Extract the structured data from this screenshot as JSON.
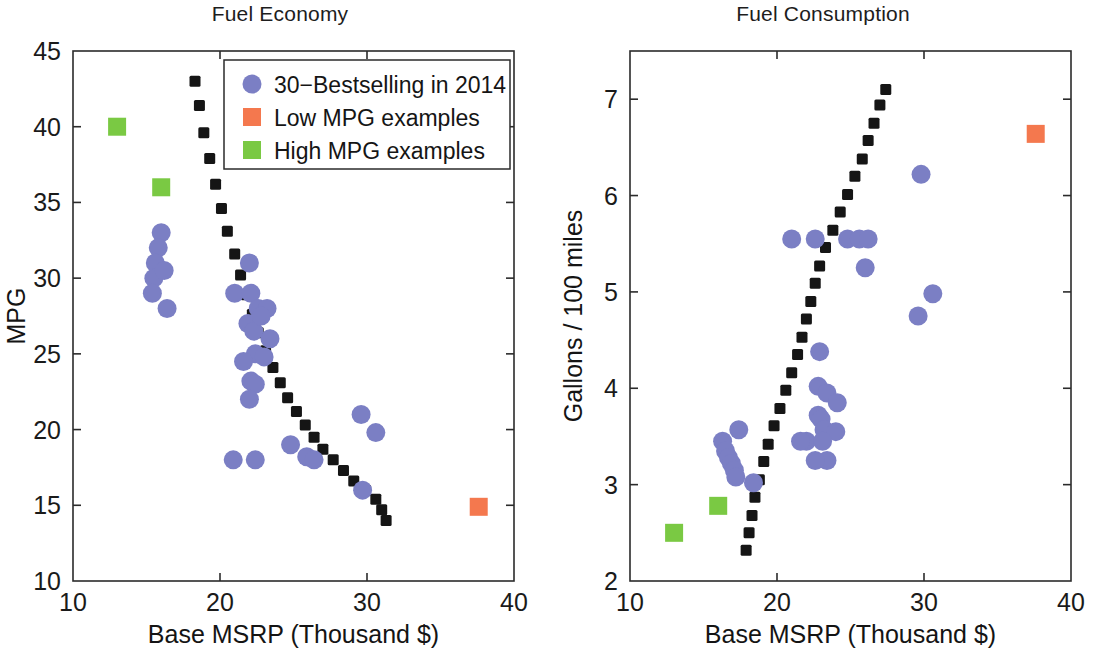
{
  "figure": {
    "width": 1113,
    "height": 649,
    "background": "#ffffff",
    "colors": {
      "bestselling_blue": "#7b7fc4",
      "low_mpg_orange": "#f4784e",
      "high_mpg_green": "#7ac943",
      "trendline_black": "#151515",
      "axis_black": "#2b2b2b"
    }
  },
  "legend": {
    "position": "top-right of left panel",
    "entries": [
      {
        "label": "30−Bestselling in 2014",
        "marker": "circle",
        "color": "#7b7fc4"
      },
      {
        "label": "Low MPG examples",
        "marker": "square",
        "color": "#f4784e"
      },
      {
        "label": "High MPG examples",
        "marker": "square",
        "color": "#7ac943"
      }
    ]
  },
  "chart_data": [
    {
      "id": "fuel-economy",
      "type": "scatter",
      "title": "Fuel Economy",
      "xlabel": "Base MSRP (Thousand $)",
      "ylabel": "MPG",
      "xlim": [
        10,
        40
      ],
      "ylim": [
        10,
        45
      ],
      "xticks": [
        10,
        20,
        30,
        40
      ],
      "xtick_labels": [
        "10",
        "20",
        "30",
        "40"
      ],
      "yticks": [
        10,
        15,
        20,
        25,
        30,
        35,
        40,
        45
      ],
      "ytick_labels": [
        "10",
        "15",
        "20",
        "25",
        "30",
        "35",
        "40",
        "45"
      ],
      "grid": false,
      "legend_position": "upper right",
      "series": [
        {
          "name": "30−Bestselling in 2014",
          "marker": "circle",
          "color": "#7b7fc4",
          "points": [
            [
              16.0,
              33.0
            ],
            [
              15.8,
              32.0
            ],
            [
              15.6,
              31.0
            ],
            [
              15.5,
              30.0
            ],
            [
              15.4,
              29.0
            ],
            [
              16.4,
              28.0
            ],
            [
              21.0,
              29.0
            ],
            [
              22.1,
              29.0
            ],
            [
              22.6,
              28.0
            ],
            [
              23.2,
              28.0
            ],
            [
              22.0,
              31.0
            ],
            [
              21.9,
              27.0
            ],
            [
              22.3,
              26.5
            ],
            [
              23.4,
              26.0
            ],
            [
              22.4,
              25.0
            ],
            [
              22.1,
              23.2
            ],
            [
              22.4,
              23.0
            ],
            [
              29.6,
              21.0
            ],
            [
              30.6,
              19.8
            ],
            [
              24.8,
              19.0
            ],
            [
              25.9,
              18.2
            ],
            [
              26.4,
              18.0
            ],
            [
              20.9,
              18.0
            ],
            [
              22.4,
              18.0
            ],
            [
              29.7,
              16.0
            ],
            [
              22.0,
              22.0
            ],
            [
              16.2,
              30.5
            ],
            [
              22.8,
              27.5
            ],
            [
              21.6,
              24.5
            ],
            [
              23.0,
              24.8
            ]
          ]
        },
        {
          "name": "Low MPG examples",
          "marker": "square",
          "color": "#f4784e",
          "points": [
            [
              37.6,
              14.9
            ]
          ]
        },
        {
          "name": "High MPG examples",
          "marker": "square",
          "color": "#7ac943",
          "points": [
            [
              13.0,
              40.0
            ],
            [
              16.0,
              36.0
            ]
          ]
        }
      ],
      "trendline": {
        "style": "dotted",
        "color": "#151515",
        "description": "decreasing hyperbolic fit",
        "points": [
          [
            18.3,
            43.0
          ],
          [
            18.6,
            41.4
          ],
          [
            18.9,
            39.6
          ],
          [
            19.3,
            37.9
          ],
          [
            19.7,
            36.2
          ],
          [
            20.1,
            34.6
          ],
          [
            20.5,
            33.1
          ],
          [
            21.0,
            31.6
          ],
          [
            21.4,
            30.2
          ],
          [
            21.8,
            28.9
          ],
          [
            22.2,
            27.6
          ],
          [
            22.6,
            26.4
          ],
          [
            23.1,
            25.2
          ],
          [
            23.6,
            24.1
          ],
          [
            24.1,
            23.1
          ],
          [
            24.6,
            22.1
          ],
          [
            25.2,
            21.2
          ],
          [
            25.8,
            20.3
          ],
          [
            26.4,
            19.5
          ],
          [
            27.0,
            18.7
          ],
          [
            27.7,
            18.0
          ],
          [
            28.4,
            17.3
          ],
          [
            29.1,
            16.6
          ],
          [
            29.9,
            16.0
          ],
          [
            30.6,
            15.4
          ],
          [
            31.0,
            14.7
          ],
          [
            31.3,
            14.0
          ]
        ]
      }
    },
    {
      "id": "fuel-consumption",
      "type": "scatter",
      "title": "Fuel Consumption",
      "xlabel": "Base MSRP (Thousand $)",
      "ylabel": "Gallons / 100 miles",
      "xlim": [
        10,
        40
      ],
      "ylim": [
        2,
        7.5
      ],
      "xticks": [
        10,
        20,
        30,
        40
      ],
      "xtick_labels": [
        "10",
        "20",
        "30",
        "40"
      ],
      "yticks": [
        2,
        3,
        4,
        5,
        6,
        7
      ],
      "ytick_labels": [
        "2",
        "3",
        "4",
        "5",
        "6",
        "7"
      ],
      "grid": false,
      "legend_position": "none",
      "series": [
        {
          "name": "30−Bestselling in 2014",
          "marker": "circle",
          "color": "#7b7fc4",
          "points": [
            [
              29.8,
              6.22
            ],
            [
              21.0,
              5.55
            ],
            [
              22.6,
              5.55
            ],
            [
              24.8,
              5.55
            ],
            [
              25.6,
              5.55
            ],
            [
              26.2,
              5.55
            ],
            [
              26.0,
              5.25
            ],
            [
              30.6,
              4.98
            ],
            [
              29.6,
              4.75
            ],
            [
              22.9,
              4.38
            ],
            [
              22.8,
              4.02
            ],
            [
              23.4,
              3.95
            ],
            [
              24.1,
              3.85
            ],
            [
              22.8,
              3.72
            ],
            [
              23.0,
              3.68
            ],
            [
              23.2,
              3.57
            ],
            [
              24.0,
              3.55
            ],
            [
              17.4,
              3.57
            ],
            [
              16.3,
              3.45
            ],
            [
              22.0,
              3.45
            ],
            [
              23.1,
              3.45
            ],
            [
              16.5,
              3.35
            ],
            [
              16.7,
              3.28
            ],
            [
              16.9,
              3.22
            ],
            [
              23.4,
              3.25
            ],
            [
              17.1,
              3.15
            ],
            [
              17.2,
              3.08
            ],
            [
              18.4,
              3.02
            ],
            [
              21.6,
              3.45
            ],
            [
              22.6,
              3.25
            ]
          ]
        },
        {
          "name": "Low MPG examples",
          "marker": "square",
          "color": "#f4784e",
          "points": [
            [
              37.6,
              6.64
            ]
          ]
        },
        {
          "name": "High MPG examples",
          "marker": "square",
          "color": "#7ac943",
          "points": [
            [
              13.0,
              2.5
            ],
            [
              16.0,
              2.78
            ]
          ]
        }
      ],
      "trendline": {
        "style": "dotted",
        "color": "#151515",
        "description": "increasing linear fit",
        "points": [
          [
            17.9,
            2.32
          ],
          [
            18.1,
            2.5
          ],
          [
            18.3,
            2.68
          ],
          [
            18.5,
            2.87
          ],
          [
            18.8,
            3.05
          ],
          [
            19.1,
            3.24
          ],
          [
            19.4,
            3.42
          ],
          [
            19.8,
            3.61
          ],
          [
            20.2,
            3.79
          ],
          [
            20.6,
            3.98
          ],
          [
            21.0,
            4.16
          ],
          [
            21.4,
            4.35
          ],
          [
            21.7,
            4.53
          ],
          [
            22.0,
            4.72
          ],
          [
            22.3,
            4.9
          ],
          [
            22.6,
            5.09
          ],
          [
            22.9,
            5.27
          ],
          [
            23.3,
            5.46
          ],
          [
            23.8,
            5.64
          ],
          [
            24.3,
            5.83
          ],
          [
            24.8,
            6.01
          ],
          [
            25.3,
            6.2
          ],
          [
            25.8,
            6.38
          ],
          [
            26.2,
            6.57
          ],
          [
            26.6,
            6.75
          ],
          [
            27.0,
            6.94
          ],
          [
            27.4,
            7.1
          ]
        ]
      }
    }
  ]
}
